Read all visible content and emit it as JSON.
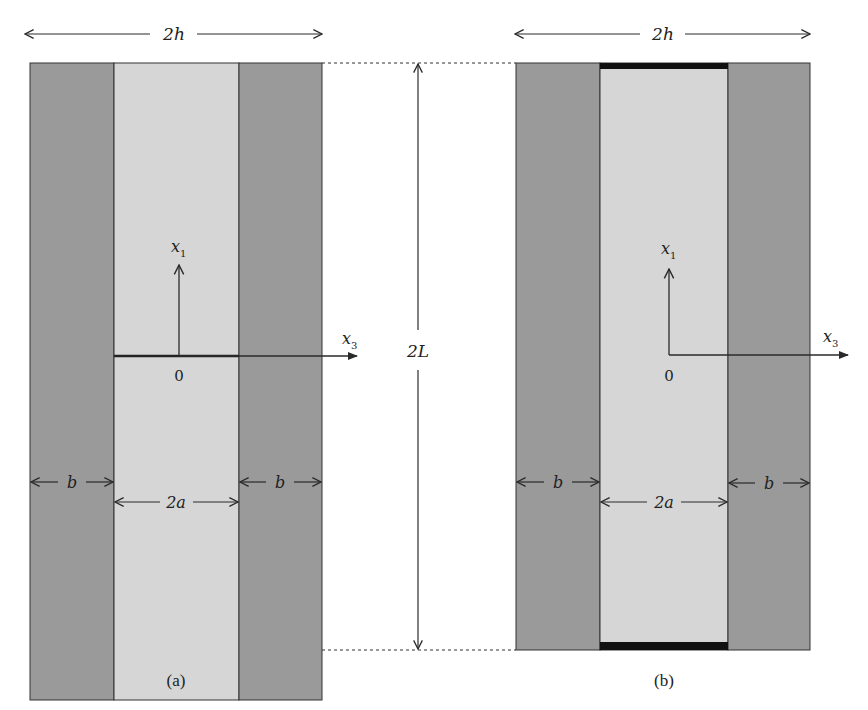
{
  "figure": {
    "panel_a": {
      "caption": "(a)",
      "width_label": "2h",
      "height_label": "2L",
      "left_layer_label": "b",
      "core_label": "2a",
      "right_layer_label": "b",
      "axis_x1_label": "x",
      "axis_x1_sub": "1",
      "axis_x3_label": "x",
      "axis_x3_sub": "3",
      "origin_label": "0",
      "crack": "central horizontal line in core"
    },
    "panel_b": {
      "caption": "(b)",
      "width_label": "2h",
      "left_layer_label": "b",
      "core_label": "2a",
      "right_layer_label": "b",
      "axis_x1_label": "x",
      "axis_x1_sub": "1",
      "axis_x3_label": "x",
      "axis_x3_sub": "3",
      "origin_label": "0",
      "electrodes": "top and bottom of core"
    },
    "colors": {
      "outer_layer": "#9a9a9a",
      "core": "#d6d6d6",
      "line": "#2a2a2a",
      "electrode": "#111111"
    }
  }
}
